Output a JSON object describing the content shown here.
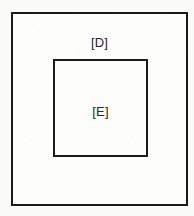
{
  "diagram": {
    "type": "nested-rectangles",
    "title": "",
    "background_color": "#fbfbfa",
    "stroke_color": "#1b1b1b",
    "fill_color": "#fdfdfc",
    "boxes": [
      {
        "id": "outer",
        "label": "[D]",
        "label_position": "top-center",
        "x": 11,
        "y": 12,
        "width": 177,
        "height": 194,
        "stroke_width": 2
      },
      {
        "id": "inner",
        "label": "[E]",
        "label_position": "center",
        "x": 53,
        "y": 59,
        "width": 95,
        "height": 98,
        "stroke_width": 2
      }
    ]
  }
}
